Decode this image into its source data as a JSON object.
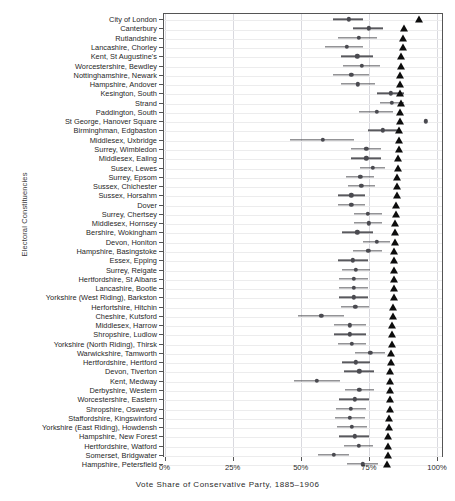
{
  "chart_data": {
    "type": "scatter",
    "title": "",
    "xlabel": "Vote Share of Conservative Party, 1885–1906",
    "ylabel": "Electoral Constituencies",
    "xlim": [
      0,
      100
    ],
    "xticks": [
      0,
      25,
      50,
      75,
      100
    ],
    "xticklabels": [
      "0%",
      "25%",
      "50%",
      "75%",
      "100%"
    ],
    "grid": true,
    "legend": null,
    "series_description": {
      "mean_dot": "mean vote share with horizontal confidence interval",
      "triangle": "maximum vote share marker"
    },
    "categories": [
      "City of London",
      "Canterbury",
      "Rutlandshire",
      "Lancashire, Chorley",
      "Kent, St Augustine's",
      "Worcestershire, Bewdley",
      "Nottinghamshire, Newark",
      "Hampshire, Andover",
      "Kesington, South",
      "Strand",
      "Paddington, South",
      "St George, Hanover Square",
      "Birminghman, Edgbaston",
      "Middlesex, Uxbridge",
      "Surrey, Wimbledon",
      "Middlesex, Ealing",
      "Susex, Lewes",
      "Surrey, Epsom",
      "Sussex, Chichester",
      "Sussex, Horsahm",
      "Dover",
      "Surrey, Chertsey",
      "Middlesex, Hornsey",
      "Bershire, Wokingham",
      "Devon, Honiton",
      "Hampshire, Basingstoke",
      "Essex, Epping",
      "Surrey, Reigate",
      "Hertfordshire, St Albans",
      "Lancashire, Bootle",
      "Yorkshire (West Riding), Barkston",
      "Herfortshire, Hitchin",
      "Cheshire, Kutsford",
      "Middlesex, Harrow",
      "Shropshire, Ludlow",
      "Yorkshire (North Riding), Thirsk",
      "Warwickshire, Tamworth",
      "Hertfordshire, Hertford",
      "Devon, Tiverton",
      "Kent, Medway",
      "Derbyshire, Western",
      "Worcestershire, Eastern",
      "Shropshire, Oswestry",
      "Staffordshire, Kingswinford",
      "Yorkshire (East Riding), Howdensh",
      "Hampshire, New Forest",
      "Hertfordshire, Watford",
      "Somerset, Bridgwater",
      "Hampshire, Petersfield",
      "Gloucestershire, Tewkesbury"
    ],
    "rows": [
      {
        "mean": 67.7,
        "low": 61.8,
        "high": 72.8,
        "max": 93.4
      },
      {
        "mean": 75.0,
        "low": 69.0,
        "high": 80.3,
        "max": 87.8
      },
      {
        "mean": 71.4,
        "low": 63.6,
        "high": 78.0,
        "max": 87.4
      },
      {
        "mean": 66.8,
        "low": 59.0,
        "high": 73.0,
        "max": 87.4
      },
      {
        "mean": 70.7,
        "low": 64.8,
        "high": 76.6,
        "max": 86.8
      },
      {
        "mean": 72.4,
        "low": 65.5,
        "high": 79.0,
        "max": 86.8
      },
      {
        "mean": 68.5,
        "low": 62.0,
        "high": 75.0,
        "max": 86.5
      },
      {
        "mean": 71.0,
        "low": 64.8,
        "high": 77.2,
        "max": 86.5
      },
      {
        "mean": 83.0,
        "low": 78.0,
        "high": 88.0,
        "max": 86.5
      },
      {
        "mean": 83.4,
        "low": 79.0,
        "high": 88.0,
        "max": 86.8
      },
      {
        "mean": 78.0,
        "low": 71.5,
        "high": 84.0,
        "max": 86.5
      },
      {
        "mean": 95.8,
        "low": 95.8,
        "high": 95.8,
        "max": 86.5
      },
      {
        "mean": 80.0,
        "low": 74.5,
        "high": 85.6,
        "max": 86.2
      },
      {
        "mean": 58.0,
        "low": 46.0,
        "high": 69.5,
        "max": 85.9
      },
      {
        "mean": 74.0,
        "low": 68.5,
        "high": 79.5,
        "max": 85.9
      },
      {
        "mean": 74.0,
        "low": 68.5,
        "high": 79.5,
        "max": 85.6
      },
      {
        "mean": 76.5,
        "low": 71.8,
        "high": 81.0,
        "max": 85.6
      },
      {
        "mean": 71.8,
        "low": 66.5,
        "high": 77.0,
        "max": 85.3
      },
      {
        "mean": 72.2,
        "low": 67.2,
        "high": 77.2,
        "max": 85.3
      },
      {
        "mean": 68.5,
        "low": 63.5,
        "high": 73.5,
        "max": 85.3
      },
      {
        "mean": 68.5,
        "low": 63.5,
        "high": 73.5,
        "max": 85.0
      },
      {
        "mean": 74.6,
        "low": 69.5,
        "high": 79.8,
        "max": 85.0
      },
      {
        "mean": 75.0,
        "low": 69.5,
        "high": 80.0,
        "max": 84.7
      },
      {
        "mean": 70.8,
        "low": 65.0,
        "high": 76.5,
        "max": 84.7
      },
      {
        "mean": 77.8,
        "low": 73.0,
        "high": 82.8,
        "max": 84.7
      },
      {
        "mean": 74.8,
        "low": 69.0,
        "high": 80.0,
        "max": 84.4
      },
      {
        "mean": 69.2,
        "low": 63.8,
        "high": 74.5,
        "max": 84.4
      },
      {
        "mean": 70.3,
        "low": 65.0,
        "high": 75.5,
        "max": 84.4
      },
      {
        "mean": 69.4,
        "low": 64.2,
        "high": 74.6,
        "max": 84.1
      },
      {
        "mean": 69.4,
        "low": 64.2,
        "high": 74.6,
        "max": 84.1
      },
      {
        "mean": 69.4,
        "low": 64.2,
        "high": 74.6,
        "max": 84.1
      },
      {
        "mean": 70.0,
        "low": 64.8,
        "high": 75.2,
        "max": 83.8
      },
      {
        "mean": 57.5,
        "low": 49.0,
        "high": 66.0,
        "max": 83.8
      },
      {
        "mean": 68.0,
        "low": 62.2,
        "high": 73.8,
        "max": 83.5
      },
      {
        "mean": 68.0,
        "low": 62.2,
        "high": 73.8,
        "max": 83.5
      },
      {
        "mean": 68.8,
        "low": 63.5,
        "high": 74.0,
        "max": 83.5
      },
      {
        "mean": 75.5,
        "low": 70.0,
        "high": 81.0,
        "max": 83.2
      },
      {
        "mean": 70.3,
        "low": 65.0,
        "high": 75.5,
        "max": 83.2
      },
      {
        "mean": 71.5,
        "low": 66.0,
        "high": 77.0,
        "max": 82.9
      },
      {
        "mean": 55.8,
        "low": 47.5,
        "high": 64.5,
        "max": 82.9
      },
      {
        "mean": 71.5,
        "low": 66.2,
        "high": 76.8,
        "max": 82.9
      },
      {
        "mean": 69.8,
        "low": 64.2,
        "high": 75.2,
        "max": 82.6
      },
      {
        "mean": 68.4,
        "low": 62.8,
        "high": 74.0,
        "max": 82.6
      },
      {
        "mean": 68.0,
        "low": 62.5,
        "high": 73.5,
        "max": 82.3
      },
      {
        "mean": 68.8,
        "low": 63.2,
        "high": 74.2,
        "max": 82.3
      },
      {
        "mean": 69.8,
        "low": 64.2,
        "high": 75.2,
        "max": 82.0
      },
      {
        "mean": 71.2,
        "low": 65.8,
        "high": 76.6,
        "max": 82.0
      },
      {
        "mean": 62.2,
        "low": 56.5,
        "high": 67.8,
        "max": 82.0
      },
      {
        "mean": 72.8,
        "low": 67.0,
        "high": 78.4,
        "max": 81.7
      }
    ]
  },
  "colors": {
    "dot": "#4a4a50",
    "ci": "#59595e",
    "triangle": "#0d0d0d",
    "grid": "#d9d9df",
    "frame": "#555555",
    "background": "#ffffff"
  }
}
